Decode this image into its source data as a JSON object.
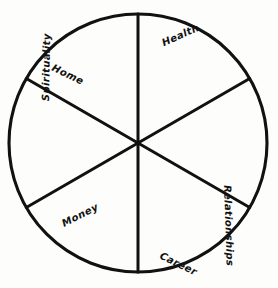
{
  "page": {
    "background_color": "#fdfdfb",
    "ink_color": "#111111"
  },
  "wheel": {
    "shape": "circle",
    "center_x": 138,
    "center_y": 143,
    "radius": 129,
    "segment_count": 6,
    "segment_angle_degrees": 60,
    "spokes": [
      {
        "name": "vertical-spoke",
        "angle_degrees": 90
      },
      {
        "name": "upper-left-to-lower-right-spoke",
        "angle_degrees": 30
      },
      {
        "name": "upper-right-to-lower-left-spoke",
        "angle_degrees": 150
      }
    ],
    "segments": [
      {
        "id": "health",
        "label": "Health",
        "position": "top-right",
        "label_x": 160,
        "label_y": 38,
        "label_rotation": 24
      },
      {
        "id": "relationships",
        "label": "Relationships",
        "position": "right",
        "label_x": 233,
        "label_y": 185,
        "label_rotation": -88
      },
      {
        "id": "career",
        "label": "Career",
        "position": "bottom-right",
        "label_x": 163,
        "label_y": 250,
        "label_rotation": -26
      },
      {
        "id": "money",
        "label": "Money",
        "position": "bottom-left",
        "label_x": 60,
        "label_y": 219,
        "label_rotation": 27
      },
      {
        "id": "spirituality",
        "label": "Spirituality",
        "position": "left",
        "label_x": 40,
        "label_y": 101,
        "label_rotation": 89
      },
      {
        "id": "home",
        "label": "Home",
        "position": "top-left",
        "label_x": 55,
        "label_y": 62,
        "label_rotation": -26
      }
    ]
  }
}
